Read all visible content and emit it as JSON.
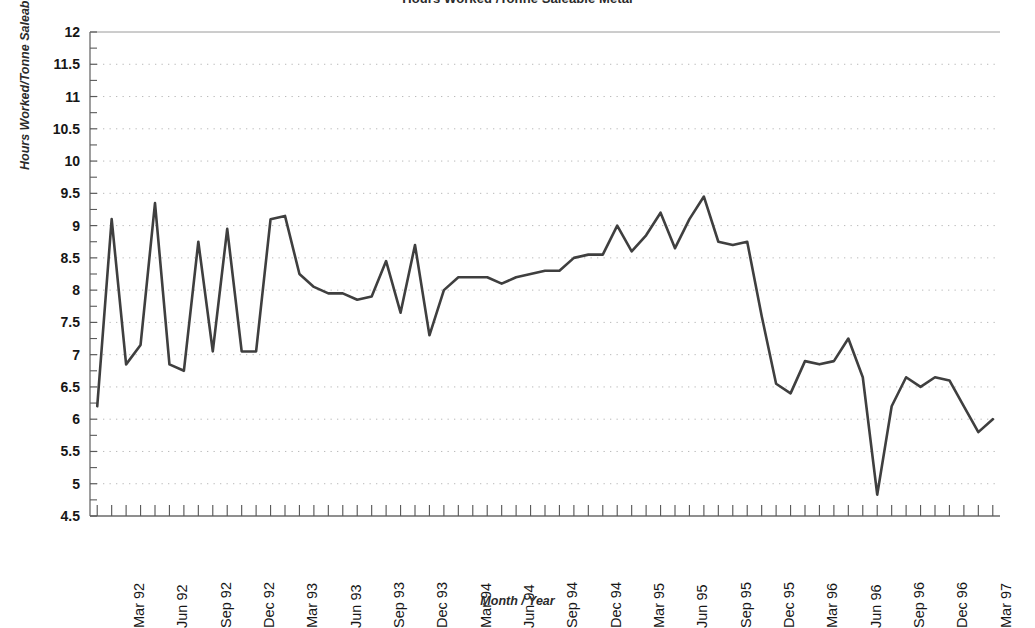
{
  "chart_data": {
    "type": "line",
    "title": "Hours Worked /Tonne Saleable Metal",
    "xlabel": "Month / Year",
    "ylabel": "Hours Worked/Tonne Saleable Metal",
    "ylim": [
      4.5,
      12
    ],
    "ytick_step": 0.5,
    "grid": true,
    "grid_style": "dotted",
    "legend": "none",
    "line_color": "#3f3f3f",
    "x_tick_frequency": "monthly",
    "x_label_frequency": "quarterly",
    "yticks": [
      "12",
      "11.5",
      "11",
      "10.5",
      "10",
      "9.5",
      "9",
      "8.5",
      "8",
      "7.5",
      "7",
      "6.5",
      "6",
      "5.5",
      "5",
      "4.5"
    ],
    "xticks": [
      "Mar 92",
      "Jun 92",
      "Sep 92",
      "Dec 92",
      "Mar 93",
      "Jun 93",
      "Sep 93",
      "Dec 93",
      "Mar 94",
      "Jun 94",
      "Sep 94",
      "Dec 94",
      "Mar 95",
      "Jun 95",
      "Sep 95",
      "Dec 95",
      "Mar 96",
      "Jun 96",
      "Sep 96",
      "Dec 96",
      "Mar 97"
    ],
    "x": [
      "Jan 92",
      "Feb 92",
      "Mar 92",
      "Apr 92",
      "May 92",
      "Jun 92",
      "Jul 92",
      "Aug 92",
      "Sep 92",
      "Oct 92",
      "Nov 92",
      "Dec 92",
      "Jan 93",
      "Feb 93",
      "Mar 93",
      "Apr 93",
      "May 93",
      "Jun 93",
      "Jul 93",
      "Aug 93",
      "Sep 93",
      "Oct 93",
      "Nov 93",
      "Dec 93",
      "Jan 94",
      "Feb 94",
      "Mar 94",
      "Apr 94",
      "May 94",
      "Jun 94",
      "Jul 94",
      "Aug 94",
      "Sep 94",
      "Oct 94",
      "Nov 94",
      "Dec 94",
      "Jan 95",
      "Feb 95",
      "Mar 95",
      "Apr 95",
      "May 95",
      "Jun 95",
      "Jul 95",
      "Aug 95",
      "Sep 95",
      "Oct 95",
      "Nov 95",
      "Dec 95",
      "Jan 96",
      "Feb 96",
      "Mar 96",
      "Apr 96",
      "May 96",
      "Jun 96",
      "Jul 96",
      "Aug 96",
      "Sep 96",
      "Oct 96",
      "Nov 96",
      "Dec 96",
      "Jan 97",
      "Feb 97",
      "Mar 97"
    ],
    "values": [
      6.2,
      9.1,
      6.85,
      7.15,
      9.35,
      6.85,
      6.75,
      8.75,
      7.05,
      8.95,
      7.05,
      7.05,
      9.1,
      9.15,
      8.25,
      8.05,
      7.95,
      7.95,
      7.85,
      7.9,
      8.45,
      7.65,
      8.7,
      7.3,
      8.0,
      8.2,
      8.2,
      8.2,
      8.1,
      8.2,
      8.25,
      8.3,
      8.3,
      8.5,
      8.55,
      8.55,
      9.0,
      8.6,
      8.85,
      9.2,
      8.65,
      9.1,
      9.45,
      8.75,
      8.7,
      8.75,
      7.6,
      6.55,
      6.4,
      6.9,
      6.85,
      6.9,
      7.25,
      6.65,
      4.83,
      6.2,
      6.65,
      6.5,
      6.65,
      6.6,
      6.2,
      5.8,
      6.0
    ]
  },
  "plot_area": {
    "left": 90,
    "right": 1000,
    "top": 32,
    "bottom": 516
  }
}
